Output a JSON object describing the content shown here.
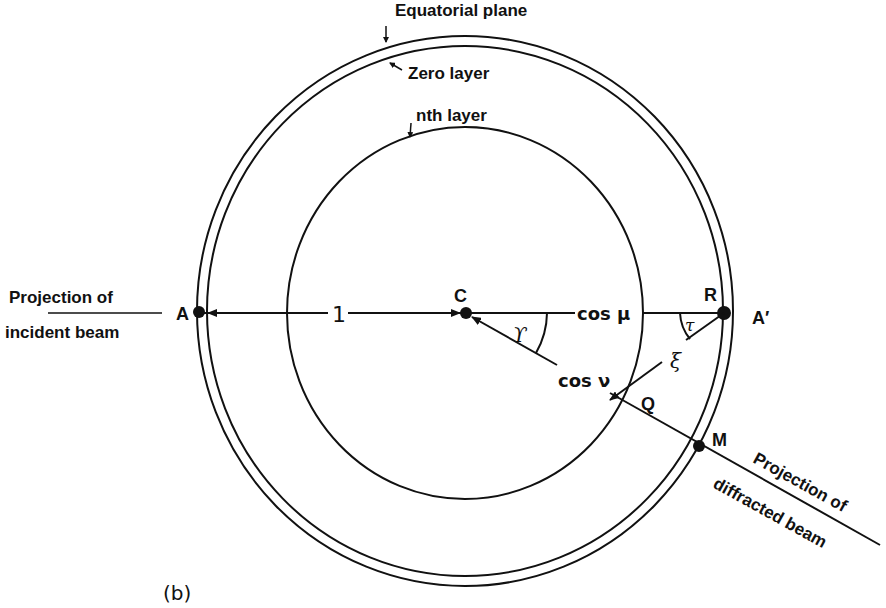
{
  "figure": {
    "panel_label": "(b)",
    "colors": {
      "ink": "#111111",
      "background": "#ffffff"
    }
  },
  "circles": {
    "equatorial_plane": "Equatorial plane",
    "zero_layer": "Zero layer",
    "nth_layer": "nth layer"
  },
  "points": {
    "A": "A",
    "A_prime": "A′",
    "C": "C",
    "R": "R",
    "Q": "Q",
    "M": "M"
  },
  "segments": {
    "AC_length": "1",
    "CR_label": "cos μ",
    "CQ_label": "cos ν",
    "RQ_label": "ξ"
  },
  "angles": {
    "at_C": "ϒ",
    "at_R": "τ"
  },
  "beams": {
    "incident_line1": "Projection of",
    "incident_line2": "incident beam",
    "diffracted_line1": "Projection of",
    "diffracted_line2": "diffracted beam"
  }
}
